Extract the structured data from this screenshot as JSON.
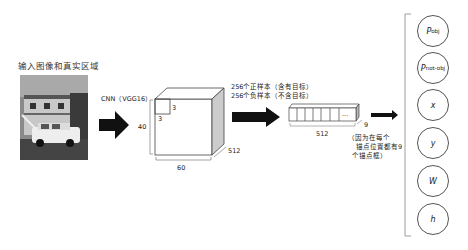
{
  "input": {
    "title": "输入图像和真实区域",
    "image_description": "grayscale photo of a white station wagon car parked in front of a house"
  },
  "cnn": {
    "label": "CNN（VGG16）"
  },
  "feature_map": {
    "height_label": "40",
    "width_label": "60",
    "depth_label": "512",
    "kernel_w_label": "3",
    "kernel_h_label": "3"
  },
  "samples": {
    "positive": "256个正样本（含有目标）",
    "negative": "256个负样本（不含目标）"
  },
  "vector": {
    "length_label": "512",
    "count_label": "9",
    "ellipsis": "...",
    "note_line1": "（因为在每个",
    "note_line2": "锚点位置都有9",
    "note_line3": "个锚点框）"
  },
  "outputs": [
    {
      "main": "P",
      "sub": "obj"
    },
    {
      "main": "P",
      "sub": "not-obj"
    },
    {
      "main": "x",
      "sub": ""
    },
    {
      "main": "y",
      "sub": ""
    },
    {
      "main": "W",
      "sub": ""
    },
    {
      "main": "h",
      "sub": ""
    }
  ]
}
